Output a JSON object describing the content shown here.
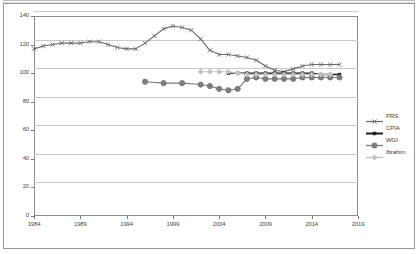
{
  "chart_data": {
    "type": "line",
    "title": "",
    "xlabel": "",
    "ylabel": "",
    "xlim": [
      1984,
      2019
    ],
    "ylim": [
      0,
      140
    ],
    "grid": true,
    "legend_position": "right",
    "y_ticks": [
      0,
      20,
      40,
      60,
      80,
      100,
      120,
      140
    ],
    "x_ticks": [
      1984,
      1989,
      1994,
      1999,
      2004,
      2009,
      2014,
      2019
    ],
    "series": [
      {
        "name": "PRS",
        "color": "#6b6b6b",
        "marker": "x",
        "x": [
          1984,
          1985,
          1986,
          1987,
          1988,
          1989,
          1990,
          1991,
          1992,
          1993,
          1994,
          1995,
          1996,
          1997,
          1998,
          1999,
          2000,
          2001,
          2002,
          2003,
          2004,
          2005,
          2006,
          2007,
          2008,
          2009,
          2010,
          2011,
          2012,
          2013,
          2014,
          2015,
          2016,
          2017
        ],
        "values": [
          117,
          119,
          120,
          121,
          121,
          121,
          122,
          122,
          120,
          118,
          117,
          117,
          121,
          126,
          131,
          133,
          132,
          130,
          124,
          116,
          113,
          113,
          112,
          111,
          109,
          105,
          102,
          101,
          103,
          105,
          106,
          106,
          106,
          106
        ]
      },
      {
        "name": "CPIA",
        "color": "#1c1c1c",
        "marker": "square",
        "x": [
          2005,
          2006,
          2007,
          2008,
          2009,
          2010,
          2011,
          2012,
          2013,
          2014,
          2015,
          2016,
          2017
        ],
        "values": [
          100,
          100,
          100,
          100,
          100,
          100,
          100,
          100,
          100,
          100,
          99,
          99,
          99
        ]
      },
      {
        "name": "WGI",
        "color": "#7d7d7d",
        "marker": "circle",
        "x": [
          1996,
          1998,
          2000,
          2002,
          2003,
          2004,
          2005,
          2006,
          2007,
          2008,
          2009,
          2010,
          2011,
          2012,
          2013,
          2014,
          2015,
          2016,
          2017
        ],
        "values": [
          94,
          93,
          93,
          92,
          91,
          89,
          88,
          89,
          96,
          97,
          96,
          96,
          96,
          96,
          97,
          97,
          97,
          97,
          97
        ]
      },
      {
        "name": "Ibrahim",
        "color": "#c2c2c2",
        "marker": "diamond",
        "x": [
          2002,
          2003,
          2004,
          2005,
          2006,
          2007,
          2008,
          2009,
          2010,
          2011,
          2012,
          2013,
          2014,
          2015,
          2016
        ],
        "values": [
          101,
          101,
          101,
          101,
          100,
          99,
          99,
          99,
          99,
          99,
          99,
          99,
          99,
          99,
          99
        ]
      }
    ]
  },
  "legend": {
    "items": [
      {
        "label": "PRS"
      },
      {
        "label": "CPIA"
      },
      {
        "label": "WGI"
      },
      {
        "label": "Ibrahim"
      }
    ]
  },
  "axis": {
    "y_labels": [
      "140",
      "120",
      "100",
      "80",
      "60",
      "40",
      "20",
      "0"
    ],
    "x_labels": [
      "1984",
      "1989",
      "1994",
      "1999",
      "2004",
      "2009",
      "2014",
      "2019"
    ]
  }
}
